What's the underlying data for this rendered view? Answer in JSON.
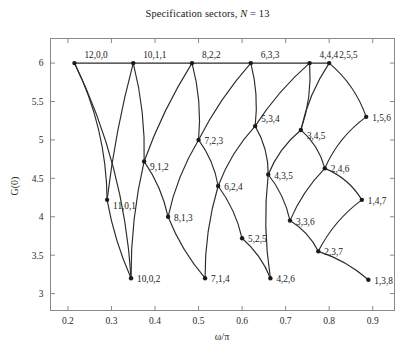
{
  "figure": {
    "width": 415,
    "height": 352,
    "background": "#ffffff",
    "line_color": "#2b2b2b",
    "axis_color": "#8a8a8a",
    "text_color": "#1a1a1a"
  },
  "chart_data": {
    "type": "scatter",
    "title": "Specification sectors, N = 13",
    "title_prefix": "Specification sectors, ",
    "title_var": "N",
    "title_suffix": " = 13",
    "xlabel": "ω/π",
    "ylabel": "G(0)",
    "xlim": [
      0.16,
      0.95
    ],
    "ylim": [
      2.78,
      6.32
    ],
    "xticks": [
      0.2,
      0.3,
      0.4,
      0.5,
      0.6,
      0.7,
      0.8,
      0.9
    ],
    "xticklabels": [
      "0.2",
      "0.3",
      "0.4",
      "0.5",
      "0.6",
      "0.7",
      "0.8",
      "0.9"
    ],
    "yticks": [
      3,
      3.5,
      4,
      4.5,
      5,
      5.5,
      6
    ],
    "yticklabels": [
      "3",
      "3.5",
      "4",
      "4.5",
      "5",
      "5.5",
      "6"
    ],
    "grid": false,
    "legend": "none",
    "points": [
      {
        "label": "12,0,0",
        "x": 0.215,
        "y": 6.0,
        "lx": 10,
        "ly": -5
      },
      {
        "label": "10,1,1",
        "x": 0.35,
        "y": 6.0,
        "lx": 10,
        "ly": -5
      },
      {
        "label": "8,2,2",
        "x": 0.485,
        "y": 6.0,
        "lx": 10,
        "ly": -5
      },
      {
        "label": "6,3,3",
        "x": 0.62,
        "y": 6.0,
        "lx": 10,
        "ly": -5
      },
      {
        "label": "4,4,4",
        "x": 0.755,
        "y": 6.0,
        "lx": 10,
        "ly": -5
      },
      {
        "label": "2,5,5",
        "x": 0.8,
        "y": 6.0,
        "lx": 10,
        "ly": -5
      },
      {
        "label": "11,0,1",
        "x": 0.29,
        "y": 4.22,
        "lx": 6,
        "ly": 9
      },
      {
        "label": "9,1,2",
        "x": 0.375,
        "y": 4.72,
        "lx": 6,
        "ly": 9
      },
      {
        "label": "7,2,3",
        "x": 0.5,
        "y": 5.0,
        "lx": 6,
        "ly": 4
      },
      {
        "label": "5,3,4",
        "x": 0.63,
        "y": 5.18,
        "lx": 6,
        "ly": -4
      },
      {
        "label": "3,4,5",
        "x": 0.735,
        "y": 5.13,
        "lx": 6,
        "ly": 9
      },
      {
        "label": "1,5,6",
        "x": 0.885,
        "y": 5.3,
        "lx": 6,
        "ly": 4
      },
      {
        "label": "10,0,2",
        "x": 0.345,
        "y": 3.2,
        "lx": 6,
        "ly": 4
      },
      {
        "label": "8,1,3",
        "x": 0.43,
        "y": 4.0,
        "lx": 6,
        "ly": 4
      },
      {
        "label": "6,2,4",
        "x": 0.545,
        "y": 4.4,
        "lx": 6,
        "ly": 4
      },
      {
        "label": "4,3,5",
        "x": 0.66,
        "y": 4.55,
        "lx": 6,
        "ly": 4
      },
      {
        "label": "2,4,6",
        "x": 0.79,
        "y": 4.63,
        "lx": 6,
        "ly": 4
      },
      {
        "label": "7,1,4",
        "x": 0.515,
        "y": 3.2,
        "lx": 6,
        "ly": 4
      },
      {
        "label": "5,2,5",
        "x": 0.6,
        "y": 3.72,
        "lx": 6,
        "ly": 4
      },
      {
        "label": "3,3,6",
        "x": 0.71,
        "y": 3.95,
        "lx": 6,
        "ly": 4
      },
      {
        "label": "1,4,7",
        "x": 0.875,
        "y": 4.22,
        "lx": 6,
        "ly": 4
      },
      {
        "label": "4,2,6",
        "x": 0.665,
        "y": 3.2,
        "lx": 6,
        "ly": 4
      },
      {
        "label": "2,3,7",
        "x": 0.775,
        "y": 3.55,
        "lx": 6,
        "ly": 4
      },
      {
        "label": "1,3,8",
        "x": 0.89,
        "y": 3.18,
        "lx": 6,
        "ly": 4
      }
    ],
    "edges": [
      {
        "from": "12,0,0",
        "to": "10,1,1",
        "bow": 0
      },
      {
        "from": "10,1,1",
        "to": "8,2,2",
        "bow": 0
      },
      {
        "from": "8,2,2",
        "to": "6,3,3",
        "bow": 0
      },
      {
        "from": "6,3,3",
        "to": "4,4,4",
        "bow": 0
      },
      {
        "from": "4,4,4",
        "to": "2,5,5",
        "bow": 0
      },
      {
        "from": "12,0,0",
        "to": "11,0,1",
        "bow": -16
      },
      {
        "from": "12,0,0",
        "to": "10,0,2",
        "bow": -22
      },
      {
        "from": "10,1,1",
        "to": "11,0,1",
        "bow": 5
      },
      {
        "from": "10,1,1",
        "to": "9,1,2",
        "bow": -7
      },
      {
        "from": "11,0,1",
        "to": "10,0,2",
        "bow": 5
      },
      {
        "from": "9,1,2",
        "to": "10,0,2",
        "bow": 7
      },
      {
        "from": "8,2,2",
        "to": "9,1,2",
        "bow": 6
      },
      {
        "from": "8,2,2",
        "to": "7,2,3",
        "bow": -7
      },
      {
        "from": "9,1,2",
        "to": "8,1,3",
        "bow": -6
      },
      {
        "from": "7,2,3",
        "to": "8,1,3",
        "bow": 7
      },
      {
        "from": "8,1,3",
        "to": "7,1,4",
        "bow": 6
      },
      {
        "from": "6,2,4",
        "to": "7,1,4",
        "bow": 7
      },
      {
        "from": "7,2,3",
        "to": "6,2,4",
        "bow": -6
      },
      {
        "from": "6,3,3",
        "to": "7,2,3",
        "bow": 6
      },
      {
        "from": "6,3,3",
        "to": "5,3,4",
        "bow": -6
      },
      {
        "from": "5,3,4",
        "to": "6,2,4",
        "bow": 7
      },
      {
        "from": "6,2,4",
        "to": "5,2,5",
        "bow": -6
      },
      {
        "from": "5,2,5",
        "to": "4,2,6",
        "bow": -6
      },
      {
        "from": "4,3,5",
        "to": "4,2,6",
        "bow": 7
      },
      {
        "from": "5,3,4",
        "to": "4,3,5",
        "bow": -7
      },
      {
        "from": "4,4,4",
        "to": "5,3,4",
        "bow": 6
      },
      {
        "from": "4,4,4",
        "to": "3,4,5",
        "bow": -7
      },
      {
        "from": "3,4,5",
        "to": "4,3,5",
        "bow": 7
      },
      {
        "from": "4,3,5",
        "to": "3,3,6",
        "bow": -6
      },
      {
        "from": "3,3,6",
        "to": "2,3,7",
        "bow": -6
      },
      {
        "from": "2,4,6",
        "to": "3,3,6",
        "bow": 6
      },
      {
        "from": "3,4,5",
        "to": "2,4,6",
        "bow": -7
      },
      {
        "from": "2,5,5",
        "to": "3,4,5",
        "bow": 7
      },
      {
        "from": "2,5,5",
        "to": "1,5,6",
        "bow": -9
      },
      {
        "from": "1,5,6",
        "to": "2,4,6",
        "bow": 9
      },
      {
        "from": "2,4,6",
        "to": "1,4,7",
        "bow": -8
      },
      {
        "from": "1,4,7",
        "to": "2,3,7",
        "bow": 8
      },
      {
        "from": "2,3,7",
        "to": "1,3,8",
        "bow": -6
      }
    ]
  }
}
